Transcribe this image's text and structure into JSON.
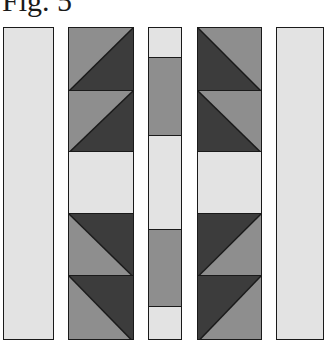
{
  "title": "Fig. 5",
  "colors": {
    "light": "#e3e3e3",
    "medium": "#8e8e8e",
    "dark": "#3c3c3c",
    "border": "#1a1a1a"
  },
  "strips": [
    {
      "name": "strip-1-plain",
      "left": 3,
      "width": 51,
      "segments": [
        {
          "top": 27,
          "bottom": 340,
          "type": "solid",
          "color": "light"
        }
      ]
    },
    {
      "name": "strip-2-flying-geese",
      "left": 68,
      "width": 66,
      "segments": [
        {
          "top": 27,
          "bottom": 90,
          "type": "hst",
          "diagonal": "bl-tr",
          "upper": "medium",
          "lower": "dark"
        },
        {
          "top": 90,
          "bottom": 151,
          "type": "hst",
          "diagonal": "bl-tr",
          "upper": "medium",
          "lower": "dark"
        },
        {
          "top": 151,
          "bottom": 213,
          "type": "solid",
          "color": "light"
        },
        {
          "top": 213,
          "bottom": 275,
          "type": "hst",
          "diagonal": "tl-br",
          "upper": "dark",
          "lower": "medium"
        },
        {
          "top": 275,
          "bottom": 340,
          "type": "hst",
          "diagonal": "tl-br",
          "upper": "dark",
          "lower": "medium"
        }
      ]
    },
    {
      "name": "strip-3-center",
      "left": 148,
      "width": 34,
      "segments": [
        {
          "top": 27,
          "bottom": 57,
          "type": "solid",
          "color": "light"
        },
        {
          "top": 57,
          "bottom": 135,
          "type": "solid",
          "color": "medium"
        },
        {
          "top": 135,
          "bottom": 229,
          "type": "solid",
          "color": "light"
        },
        {
          "top": 229,
          "bottom": 306,
          "type": "solid",
          "color": "medium"
        },
        {
          "top": 306,
          "bottom": 340,
          "type": "solid",
          "color": "light"
        }
      ]
    },
    {
      "name": "strip-4-flying-geese",
      "left": 197,
      "width": 65,
      "segments": [
        {
          "top": 27,
          "bottom": 90,
          "type": "hst",
          "diagonal": "tl-br",
          "upper": "medium",
          "lower": "dark"
        },
        {
          "top": 90,
          "bottom": 151,
          "type": "hst",
          "diagonal": "tl-br",
          "upper": "medium",
          "lower": "dark"
        },
        {
          "top": 151,
          "bottom": 213,
          "type": "solid",
          "color": "light"
        },
        {
          "top": 213,
          "bottom": 275,
          "type": "hst",
          "diagonal": "bl-tr",
          "upper": "dark",
          "lower": "medium"
        },
        {
          "top": 275,
          "bottom": 340,
          "type": "hst",
          "diagonal": "bl-tr",
          "upper": "dark",
          "lower": "medium"
        }
      ]
    },
    {
      "name": "strip-5-plain",
      "left": 276,
      "width": 48,
      "segments": [
        {
          "top": 27,
          "bottom": 340,
          "type": "solid",
          "color": "light"
        }
      ]
    }
  ]
}
